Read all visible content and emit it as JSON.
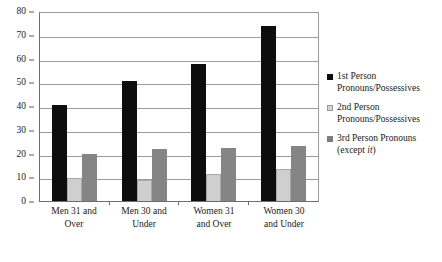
{
  "chart_data": {
    "type": "bar",
    "title": "",
    "xlabel": "",
    "ylabel": "",
    "ylim": [
      0,
      80
    ],
    "y_ticks": [
      0,
      10,
      20,
      30,
      40,
      50,
      60,
      70,
      80
    ],
    "grid": true,
    "legend_position": "right",
    "categories": [
      "Men 31 and Over",
      "Men 30 and Under",
      "Women 31 and Over",
      "Women 30 and Under"
    ],
    "category_lines": [
      [
        "Men 31 and",
        "Over"
      ],
      [
        "Men 30 and",
        "Under"
      ],
      [
        "Women 31",
        "and Over"
      ],
      [
        "Women 30",
        "and Under"
      ]
    ],
    "series": [
      {
        "name": "1st Person Pronouns/Possessives",
        "legend_lines": [
          "1st Person",
          "Pronouns/Possessives"
        ],
        "color": "#0d0d0d",
        "values": [
          41,
          51,
          58.5,
          74.5
        ]
      },
      {
        "name": "2nd Person Pronouns/Possessives",
        "legend_lines": [
          "2nd Person",
          "Pronouns/Possessives"
        ],
        "color": "#cfcfcf",
        "values": [
          10,
          9,
          11.5,
          13.5
        ]
      },
      {
        "name": "3rd Person Pronouns (except it)",
        "legend_lines": [
          "3rd Person Pronouns",
          "(except it)"
        ],
        "color": "#858585",
        "values": [
          20,
          22,
          22.5,
          23.5
        ]
      }
    ]
  },
  "legend": {
    "items": [
      {
        "line1": "1st Person",
        "line2": "Pronouns/Possessives",
        "italic_tail": ""
      },
      {
        "line1": "2nd Person",
        "line2": "Pronouns/Possessives",
        "italic_tail": ""
      },
      {
        "line1": "3rd Person Pronouns",
        "line2": "(except ",
        "italic_tail": "it",
        "line2_end": ")"
      }
    ]
  }
}
